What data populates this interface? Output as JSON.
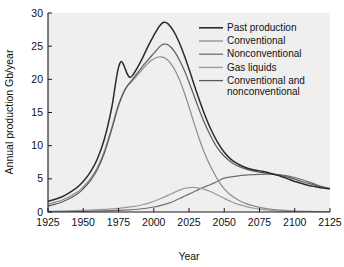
{
  "chart_data": {
    "type": "line",
    "title": "",
    "xlabel": "Year",
    "ylabel": "Annual production Gb/year",
    "xlim": [
      1925,
      2125
    ],
    "ylim": [
      0,
      30
    ],
    "xticks": [
      1925,
      1950,
      1975,
      2000,
      2025,
      2050,
      2075,
      2100,
      2125
    ],
    "yticks": [
      0,
      5,
      10,
      15,
      20,
      25,
      30
    ],
    "grid": false,
    "legend_position": "upper right",
    "series": [
      {
        "name": "Past production",
        "color": "#2b2b2b",
        "x": [
          1925,
          1935,
          1945,
          1950,
          1955,
          1960,
          1965,
          1970,
          1973,
          1975,
          1977,
          1979,
          1981,
          1983,
          1985,
          1988,
          1992,
          1996,
          2000,
          2004,
          2007,
          2010,
          2014,
          2018,
          2022,
          2026,
          2030,
          2035,
          2040,
          2045,
          2050,
          2055,
          2060,
          2065,
          2070,
          2075,
          2080,
          2085,
          2090,
          2095,
          2100,
          2105,
          2110,
          2115,
          2120,
          2125
        ],
        "y": [
          1.6,
          2.3,
          3.6,
          4.6,
          6.0,
          8.0,
          11.0,
          15.5,
          19.5,
          21.8,
          22.7,
          22.0,
          20.9,
          20.3,
          20.6,
          21.6,
          23.2,
          25.0,
          26.6,
          28.0,
          28.6,
          28.4,
          27.3,
          25.6,
          23.4,
          20.9,
          18.3,
          15.3,
          12.7,
          10.6,
          9.0,
          7.9,
          7.2,
          6.7,
          6.4,
          6.2,
          6.0,
          5.7,
          5.4,
          5.0,
          4.6,
          4.3,
          4.0,
          3.8,
          3.6,
          3.5
        ]
      },
      {
        "name": "Conventional",
        "color": "#8c8c8c",
        "x": [
          1925,
          1935,
          1945,
          1950,
          1955,
          1960,
          1965,
          1970,
          1975,
          1980,
          1985,
          1990,
          1994,
          1998,
          2002,
          2005,
          2008,
          2012,
          2016,
          2020,
          2024,
          2028,
          2032,
          2036,
          2040,
          2045,
          2050,
          2055,
          2060,
          2065,
          2070,
          2075,
          2080,
          2085,
          2090,
          2095,
          2100,
          2110,
          2120,
          2125
        ],
        "y": [
          1.2,
          1.8,
          2.9,
          3.8,
          5.0,
          6.7,
          9.2,
          12.6,
          16.2,
          18.6,
          19.8,
          21.0,
          22.0,
          22.8,
          23.3,
          23.4,
          23.2,
          22.4,
          21.0,
          19.0,
          16.5,
          13.8,
          11.2,
          8.9,
          7.0,
          5.0,
          3.5,
          2.5,
          1.8,
          1.3,
          0.95,
          0.7,
          0.5,
          0.38,
          0.28,
          0.2,
          0.15,
          0.08,
          0.04,
          0.03
        ]
      },
      {
        "name": "Nonconventional",
        "color": "#6e6e6e",
        "x": [
          1925,
          1950,
          1970,
          1980,
          1990,
          2000,
          2005,
          2010,
          2015,
          2020,
          2025,
          2030,
          2035,
          2040,
          2045,
          2050,
          2055,
          2060,
          2065,
          2070,
          2075,
          2080,
          2085,
          2090,
          2095,
          2100,
          2105,
          2110,
          2115,
          2120,
          2125
        ],
        "y": [
          0.05,
          0.1,
          0.2,
          0.3,
          0.45,
          0.75,
          1.0,
          1.3,
          1.7,
          2.2,
          2.7,
          3.2,
          3.7,
          4.1,
          4.6,
          5.1,
          5.3,
          5.45,
          5.55,
          5.62,
          5.68,
          5.7,
          5.68,
          5.6,
          5.45,
          5.2,
          4.9,
          4.55,
          4.15,
          3.8,
          3.5
        ]
      },
      {
        "name": "Gas liquids",
        "color": "#9a9a9a",
        "x": [
          1925,
          1950,
          1965,
          1975,
          1985,
          1992,
          1998,
          2004,
          2010,
          2015,
          2020,
          2024,
          2028,
          2032,
          2036,
          2040,
          2045,
          2050,
          2055,
          2060,
          2065,
          2070,
          2075,
          2080,
          2085,
          2090,
          2095,
          2100,
          2110,
          2125
        ],
        "y": [
          0.1,
          0.25,
          0.4,
          0.55,
          0.8,
          1.1,
          1.45,
          1.95,
          2.5,
          3.0,
          3.45,
          3.65,
          3.7,
          3.6,
          3.4,
          3.1,
          2.6,
          2.05,
          1.55,
          1.15,
          0.85,
          0.6,
          0.42,
          0.3,
          0.2,
          0.13,
          0.08,
          0.05,
          0.02,
          0.0
        ]
      },
      {
        "name": "Conventional and nonconventional",
        "color": "#5a5a5a",
        "x": [
          1925,
          1935,
          1945,
          1950,
          1955,
          1960,
          1965,
          1970,
          1975,
          1980,
          1985,
          1990,
          1995,
          2000,
          2004,
          2007,
          2010,
          2014,
          2018,
          2022,
          2026,
          2030,
          2035,
          2040,
          2045,
          2050,
          2055,
          2060,
          2065,
          2070,
          2075,
          2080,
          2085,
          2090,
          2095,
          2100,
          2105,
          2110,
          2115,
          2120,
          2125
        ],
        "y": [
          0.9,
          1.5,
          2.6,
          3.5,
          4.7,
          6.4,
          8.9,
          12.3,
          16.0,
          18.6,
          20.0,
          21.4,
          22.7,
          23.9,
          24.9,
          25.3,
          25.2,
          24.4,
          23.0,
          21.2,
          19.0,
          16.7,
          13.9,
          11.6,
          9.7,
          8.4,
          7.5,
          6.9,
          6.5,
          6.2,
          6.0,
          5.85,
          5.7,
          5.5,
          5.25,
          4.95,
          4.6,
          4.3,
          4.0,
          3.75,
          3.55
        ]
      }
    ]
  },
  "legend": {
    "entries": [
      {
        "label": "Past production"
      },
      {
        "label": "Conventional"
      },
      {
        "label": "Nonconventional"
      },
      {
        "label": "Gas liquids"
      },
      {
        "label": "Conventional and"
      },
      {
        "label": "nonconventional"
      }
    ]
  },
  "colors": {
    "plot_background": "#efefef",
    "figure_background": "#ffffff",
    "axis": "#1a1a1a",
    "text": "#111111"
  }
}
